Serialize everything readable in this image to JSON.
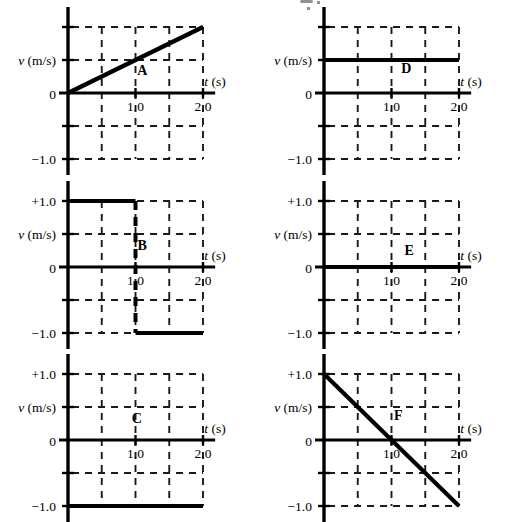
{
  "figure": {
    "panel_count": 6,
    "axis": {
      "x_label_var": "t",
      "x_label_unit": "(s)",
      "y_label": "v  (m/s)",
      "x_ticks": [
        "1.0",
        "2.0"
      ],
      "x_tick_values": [
        1.0,
        2.0
      ],
      "y_tick_top": "+1.0",
      "y_tick_zero": "0",
      "y_tick_bottom": "−1.0",
      "x_range": [
        0,
        2.2
      ],
      "y_range": [
        -1.0,
        1.0
      ],
      "grid_x_values": [
        0.5,
        1.0,
        1.5,
        2.0
      ],
      "grid_y_values": [
        1.0,
        0.5,
        -0.5,
        -1.0
      ],
      "grid_style": "dashed"
    },
    "colors": {
      "ink": "#000000",
      "grid": "#1a1a1a",
      "background": "#ffffff"
    },
    "panels": [
      {
        "id": "A",
        "letter": "A",
        "position": "top-left",
        "show_top_label": false,
        "y_labels": [
          "v  (m/s)",
          "0",
          "−1.0"
        ],
        "description": "constant positive acceleration from rest",
        "chart_data": {
          "type": "line",
          "x": [
            0.0,
            2.0
          ],
          "y": [
            0.0,
            1.0
          ],
          "segments": [
            {
              "x": [
                0.0,
                2.0
              ],
              "y": [
                0.0,
                1.0
              ]
            }
          ]
        }
      },
      {
        "id": "B",
        "letter": "B",
        "position": "middle-left",
        "show_top_label": true,
        "y_labels": [
          "+1.0",
          "v  (m/s)",
          "0",
          "−1.0"
        ],
        "description": "step from +1.0 to -1.0 at t = 1.0 s",
        "chart_data": {
          "type": "line",
          "x": [
            0.0,
            1.0,
            1.0,
            2.0
          ],
          "y": [
            1.0,
            1.0,
            -1.0,
            -1.0
          ],
          "segments": [
            {
              "x": [
                0.0,
                1.0
              ],
              "y": [
                1.0,
                1.0
              ]
            },
            {
              "x": [
                1.0,
                1.0
              ],
              "y": [
                1.0,
                -1.0
              ],
              "dashed": true
            },
            {
              "x": [
                1.0,
                2.0
              ],
              "y": [
                -1.0,
                -1.0
              ]
            }
          ]
        }
      },
      {
        "id": "C",
        "letter": "C",
        "position": "bottom-left",
        "show_top_label": true,
        "y_labels": [
          "+1.0",
          "v  (m/s)",
          "0",
          "−1.0"
        ],
        "description": "constant velocity at -1.0 m/s",
        "chart_data": {
          "type": "line",
          "x": [
            0.0,
            2.0
          ],
          "y": [
            -1.0,
            -1.0
          ],
          "segments": [
            {
              "x": [
                0.0,
                2.0
              ],
              "y": [
                -1.0,
                -1.0
              ]
            }
          ]
        }
      },
      {
        "id": "D",
        "letter": "D",
        "position": "top-right",
        "show_top_label": false,
        "y_labels": [
          "v  (m/s)",
          "0",
          "−1.0"
        ],
        "description": "constant velocity at +0.5 m/s",
        "chart_data": {
          "type": "line",
          "x": [
            0.0,
            2.0
          ],
          "y": [
            0.5,
            0.5
          ],
          "segments": [
            {
              "x": [
                0.0,
                2.0
              ],
              "y": [
                0.5,
                0.5
              ]
            }
          ]
        }
      },
      {
        "id": "E",
        "letter": "E",
        "position": "middle-right",
        "show_top_label": true,
        "y_labels": [
          "+1.0",
          "v  (m/s)",
          "0",
          "−1.0"
        ],
        "description": "velocity zero for all time (object at rest)",
        "chart_data": {
          "type": "line",
          "x": [
            0.0,
            2.0
          ],
          "y": [
            0.0,
            0.0
          ],
          "segments": [
            {
              "x": [
                0.0,
                2.0
              ],
              "y": [
                0.0,
                0.0
              ]
            }
          ]
        }
      },
      {
        "id": "F",
        "letter": "F",
        "position": "bottom-right",
        "show_top_label": true,
        "y_labels": [
          "+1.0",
          "v  (m/s)",
          "0",
          "−1.0"
        ],
        "description": "constant negative acceleration, crosses zero at t = 1.0 s",
        "chart_data": {
          "type": "line",
          "x": [
            0.0,
            2.0
          ],
          "y": [
            1.0,
            -1.0
          ],
          "segments": [
            {
              "x": [
                0.0,
                2.0
              ],
              "y": [
                1.0,
                -1.0
              ]
            }
          ]
        }
      }
    ]
  }
}
